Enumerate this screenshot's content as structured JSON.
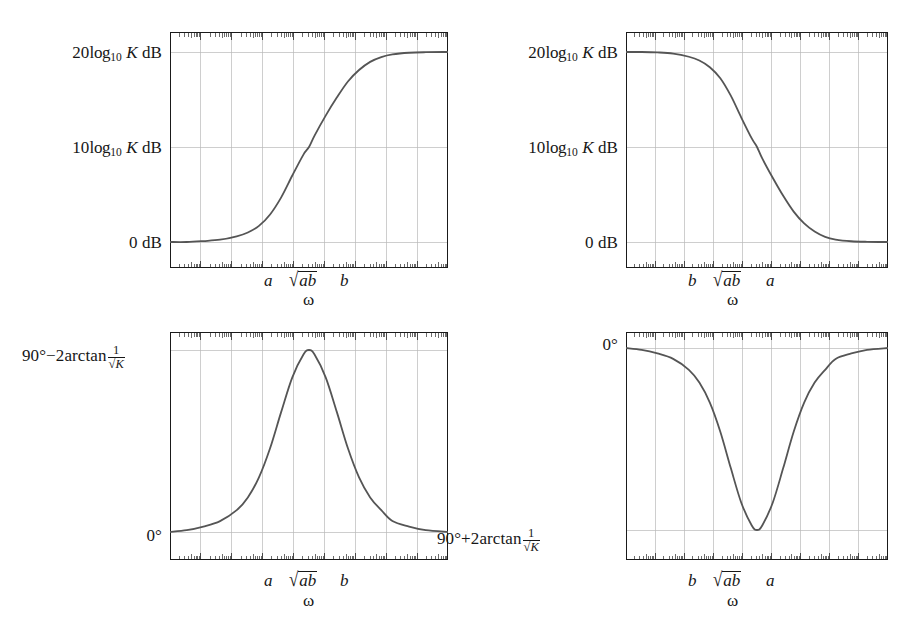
{
  "figure": {
    "kind": "four-bode-plots",
    "ink_color": "#555555",
    "axis_color": "#1a1a1a",
    "grid_color": "#b9b9b9",
    "background": "#ffffff"
  },
  "panels": [
    {
      "id": "lead-magnitude",
      "position": "top-left",
      "y_labels": [
        {
          "text": "20log10 K dB",
          "value_at": "top"
        },
        {
          "text": "10log10 K dB",
          "value_at": "middle"
        },
        {
          "text": "0 dB",
          "value_at": "bottom"
        }
      ],
      "y_label_parts": {
        "top": {
          "coef": "20",
          "log": "log",
          "base": "10",
          "var": "K",
          "unit": "dB"
        },
        "middle": {
          "coef": "10",
          "log": "log",
          "base": "10",
          "var": "K",
          "unit": "dB"
        },
        "bottom": {
          "text": "0 dB"
        }
      },
      "x_ticks": [
        "a",
        "ab",
        "b"
      ],
      "x_tick_display": [
        "a",
        "√ab",
        "b"
      ],
      "x_axis_label": "ω",
      "curve": "rising-sigmoid"
    },
    {
      "id": "lag-magnitude",
      "position": "top-right",
      "y_labels": [
        {
          "text": "20log10 K dB",
          "value_at": "top"
        },
        {
          "text": "10log10 K dB",
          "value_at": "middle"
        },
        {
          "text": "0 dB",
          "value_at": "bottom"
        }
      ],
      "y_label_parts": {
        "top": {
          "coef": "20",
          "log": "log",
          "base": "10",
          "var": "K",
          "unit": "dB"
        },
        "middle": {
          "coef": "10",
          "log": "log",
          "base": "10",
          "var": "K",
          "unit": "dB"
        },
        "bottom": {
          "text": "0 dB"
        }
      },
      "x_ticks": [
        "b",
        "ab",
        "a"
      ],
      "x_tick_display": [
        "b",
        "√ab",
        "a"
      ],
      "x_axis_label": "ω",
      "curve": "falling-sigmoid"
    },
    {
      "id": "lead-phase",
      "position": "bottom-left",
      "y_labels": [
        {
          "text": "90°−2arctan 1/√K",
          "value_at": "top"
        },
        {
          "text": "0°",
          "value_at": "bottom"
        }
      ],
      "y_label_parts": {
        "top": {
          "angle": "90°",
          "sign": "−",
          "coef": "2",
          "fn": "arctan",
          "num": "1",
          "den_var": "K"
        },
        "bottom": {
          "text": "0°"
        }
      },
      "x_ticks": [
        "a",
        "ab",
        "b"
      ],
      "x_tick_display": [
        "a",
        "√ab",
        "b"
      ],
      "x_axis_label": "ω",
      "curve": "positive-bump"
    },
    {
      "id": "lag-phase",
      "position": "bottom-right",
      "y_labels": [
        {
          "text": "0°",
          "value_at": "top"
        },
        {
          "text": "90°+2arctan 1/√K",
          "value_at": "bottom"
        }
      ],
      "y_label_parts": {
        "top": {
          "text": "0°"
        },
        "bottom": {
          "angle": "90°",
          "sign": "+",
          "coef": "2",
          "fn": "arctan",
          "num": "1",
          "den_var": "K"
        }
      },
      "x_ticks": [
        "b",
        "ab",
        "a"
      ],
      "x_tick_display": [
        "b",
        "√ab",
        "a"
      ],
      "x_axis_label": "ω",
      "curve": "negative-dip"
    }
  ],
  "chart_data": {
    "type": "line",
    "title": "",
    "xlabel": "ω",
    "ylabel": "",
    "grid": true,
    "legend": "none",
    "axis_scale": "log-frequency, 7 decades",
    "charts": [
      {
        "id": "lead-magnitude",
        "ylabel": "magnitude (dB)",
        "ytick_labels": [
          "0 dB",
          "10log10 K dB",
          "20log10 K dB"
        ],
        "ytick_values": [
          0,
          0.5,
          1
        ],
        "xtick_labels": [
          "a",
          "√ab",
          "b"
        ],
        "xtick_values": [
          0.36,
          0.5,
          0.64
        ],
        "x": [
          0.0,
          0.06,
          0.12,
          0.18,
          0.24,
          0.28,
          0.32,
          0.36,
          0.4,
          0.44,
          0.48,
          0.5,
          0.52,
          0.56,
          0.6,
          0.64,
          0.68,
          0.72,
          0.76,
          0.8,
          0.86,
          0.92,
          1.0
        ],
        "y": [
          0.0,
          0.0,
          0.005,
          0.012,
          0.03,
          0.05,
          0.085,
          0.145,
          0.235,
          0.35,
          0.46,
          0.5,
          0.56,
          0.665,
          0.76,
          0.845,
          0.905,
          0.948,
          0.973,
          0.987,
          0.996,
          0.999,
          1.0
        ]
      },
      {
        "id": "lag-magnitude",
        "ylabel": "magnitude (dB)",
        "ytick_labels": [
          "0 dB",
          "10log10 K dB",
          "20log10 K dB"
        ],
        "ytick_values": [
          0,
          0.5,
          1
        ],
        "xtick_labels": [
          "b",
          "√ab",
          "a"
        ],
        "xtick_values": [
          0.36,
          0.5,
          0.64
        ],
        "x": [
          0.0,
          0.06,
          0.12,
          0.18,
          0.24,
          0.28,
          0.32,
          0.36,
          0.4,
          0.44,
          0.48,
          0.5,
          0.52,
          0.56,
          0.6,
          0.64,
          0.68,
          0.72,
          0.76,
          0.8,
          0.86,
          0.92,
          1.0
        ],
        "y": [
          1.0,
          1.0,
          0.998,
          0.992,
          0.975,
          0.955,
          0.92,
          0.862,
          0.77,
          0.655,
          0.545,
          0.5,
          0.44,
          0.338,
          0.243,
          0.16,
          0.098,
          0.055,
          0.027,
          0.013,
          0.004,
          0.001,
          0.0
        ]
      },
      {
        "id": "lead-phase",
        "ylabel": "phase",
        "ytick_labels": [
          "0°",
          "90°−2arctan 1/√K"
        ],
        "ytick_values": [
          0,
          1
        ],
        "xtick_labels": [
          "a",
          "√ab",
          "b"
        ],
        "xtick_values": [
          0.36,
          0.5,
          0.64
        ],
        "x": [
          0.0,
          0.06,
          0.12,
          0.18,
          0.24,
          0.28,
          0.32,
          0.36,
          0.4,
          0.44,
          0.48,
          0.5,
          0.52,
          0.56,
          0.6,
          0.64,
          0.68,
          0.72,
          0.76,
          0.8,
          0.86,
          0.92,
          1.0
        ],
        "y": [
          0.0,
          0.01,
          0.03,
          0.06,
          0.12,
          0.19,
          0.3,
          0.46,
          0.66,
          0.85,
          0.975,
          1.0,
          0.975,
          0.85,
          0.66,
          0.46,
          0.3,
          0.19,
          0.12,
          0.06,
          0.03,
          0.01,
          0.0
        ]
      },
      {
        "id": "lag-phase",
        "ylabel": "phase",
        "ytick_labels": [
          "0°",
          "90°+2arctan 1/√K"
        ],
        "ytick_values": [
          0,
          1
        ],
        "xtick_labels": [
          "b",
          "√ab",
          "a"
        ],
        "xtick_values": [
          0.36,
          0.5,
          0.64
        ],
        "x": [
          0.0,
          0.06,
          0.12,
          0.18,
          0.24,
          0.28,
          0.32,
          0.36,
          0.4,
          0.44,
          0.48,
          0.5,
          0.52,
          0.56,
          0.6,
          0.64,
          0.68,
          0.72,
          0.76,
          0.8,
          0.86,
          0.92,
          1.0
        ],
        "y": [
          0.0,
          -0.01,
          -0.03,
          -0.06,
          -0.12,
          -0.19,
          -0.3,
          -0.46,
          -0.66,
          -0.85,
          -0.975,
          -1.0,
          -0.975,
          -0.85,
          -0.66,
          -0.46,
          -0.3,
          -0.19,
          -0.12,
          -0.06,
          -0.03,
          -0.01,
          0.0
        ]
      }
    ]
  }
}
